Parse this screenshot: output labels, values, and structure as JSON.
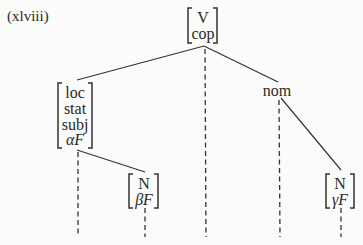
{
  "example_label": "(xlviii)",
  "tree": {
    "root": {
      "features": [
        "V",
        "cop"
      ]
    },
    "left_node": {
      "features": [
        "loc",
        "stat",
        "subj",
        "αF"
      ]
    },
    "left_child": {
      "features": [
        "N",
        "βF"
      ]
    },
    "right_node": {
      "label": "nom"
    },
    "right_child": {
      "features": [
        "N",
        "γF"
      ]
    }
  }
}
